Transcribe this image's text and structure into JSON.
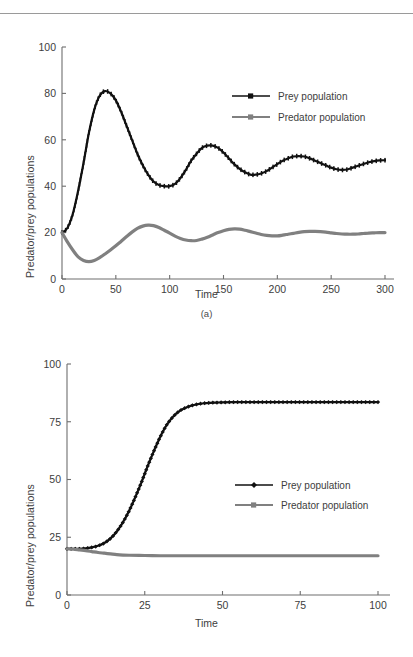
{
  "page": {
    "has_top_rule": true,
    "background": "#ffffff"
  },
  "colors": {
    "prey": "#111111",
    "predator": "#808080",
    "axis": "#6e6e6e",
    "text": "#3d3d3d"
  },
  "figures": [
    {
      "id": "a",
      "caption": "(a)",
      "chart_data": {
        "type": "line",
        "title": "",
        "xlabel": "Time",
        "ylabel": "Predator/prey populations",
        "xlim": [
          0,
          300
        ],
        "ylim": [
          0,
          100
        ],
        "xticks": [
          0,
          50,
          100,
          150,
          200,
          250,
          300
        ],
        "yticks": [
          0,
          20,
          40,
          60,
          80,
          100
        ],
        "grid": false,
        "legend_position": "upper-right-inside",
        "series": [
          {
            "name": "Prey population",
            "marker": "dot",
            "color": "#111111",
            "x": [
              0,
              5,
              10,
              15,
              20,
              25,
              30,
              35,
              40,
              45,
              50,
              55,
              60,
              65,
              70,
              75,
              80,
              85,
              90,
              95,
              100,
              105,
              110,
              115,
              120,
              125,
              130,
              135,
              140,
              145,
              150,
              155,
              160,
              165,
              170,
              175,
              180,
              185,
              190,
              195,
              200,
              205,
              210,
              215,
              220,
              225,
              230,
              235,
              240,
              245,
              250,
              255,
              260,
              265,
              270,
              275,
              280,
              285,
              290,
              295,
              300
            ],
            "y": [
              20,
              22,
              28,
              38,
              50,
              63,
              73,
              79,
              81,
              80,
              77,
              72,
              66,
              60,
              54,
              49,
              45,
              42,
              40.5,
              40,
              40,
              41,
              43.5,
              47,
              51,
              54,
              56.5,
              57.5,
              57.5,
              56.5,
              54.5,
              52,
              49.5,
              47.5,
              46,
              45,
              45,
              45.5,
              46.5,
              48,
              49.5,
              51,
              52,
              52.8,
              53,
              52.8,
              52,
              51,
              50,
              49,
              48,
              47.3,
              47,
              47.2,
              48,
              48.8,
              49.6,
              50.3,
              50.8,
              51.1,
              51.2
            ]
          },
          {
            "name": "Predator population",
            "marker": "square",
            "color": "#808080",
            "x": [
              0,
              5,
              10,
              15,
              20,
              25,
              30,
              35,
              40,
              45,
              50,
              55,
              60,
              65,
              70,
              75,
              80,
              85,
              90,
              95,
              100,
              105,
              110,
              115,
              120,
              125,
              130,
              135,
              140,
              145,
              150,
              155,
              160,
              165,
              170,
              175,
              180,
              185,
              190,
              195,
              200,
              205,
              210,
              215,
              220,
              225,
              230,
              235,
              240,
              245,
              250,
              255,
              260,
              265,
              270,
              275,
              280,
              285,
              290,
              295,
              300
            ],
            "y": [
              20,
              16,
              12.5,
              9.5,
              8,
              7.5,
              8,
              9.2,
              10.8,
              12.5,
              14.3,
              16.3,
              18.3,
              20.2,
              21.8,
              22.8,
              23.2,
              23,
              22.2,
              21,
              19.8,
              18.5,
              17.5,
              16.8,
              16.5,
              16.6,
              17.2,
              18,
              19,
              20,
              20.8,
              21.4,
              21.6,
              21.5,
              21,
              20.4,
              19.8,
              19.2,
              18.8,
              18.6,
              18.6,
              18.9,
              19.3,
              19.7,
              20.1,
              20.4,
              20.5,
              20.5,
              20.4,
              20.2,
              19.9,
              19.6,
              19.4,
              19.3,
              19.3,
              19.4,
              19.6,
              19.8,
              19.9,
              20,
              20
            ]
          }
        ]
      }
    },
    {
      "id": "b",
      "caption": "",
      "chart_data": {
        "type": "line",
        "title": "",
        "xlabel": "Time",
        "ylabel": "Predator/prey populations",
        "xlim": [
          0,
          100
        ],
        "ylim": [
          0,
          100
        ],
        "xticks": [
          0,
          25,
          50,
          75,
          100
        ],
        "yticks": [
          0,
          25,
          50,
          75,
          100
        ],
        "grid": false,
        "legend_position": "center-right-inside",
        "series": [
          {
            "name": "Prey population",
            "marker": "diamond",
            "color": "#111111",
            "x": [
              0,
              2,
              4,
              6,
              8,
              10,
              12,
              14,
              16,
              18,
              20,
              22,
              24,
              26,
              28,
              30,
              32,
              34,
              36,
              38,
              40,
              42,
              44,
              46,
              48,
              50,
              55,
              60,
              65,
              70,
              75,
              80,
              85,
              90,
              95,
              100
            ],
            "y": [
              20,
              20,
              20,
              20.2,
              20.6,
              21.3,
              22.5,
              24.5,
              27.5,
              31.5,
              36.5,
              42.5,
              49,
              56,
              62.5,
              68.5,
              73.5,
              77,
              79.5,
              81,
              82,
              82.6,
              83,
              83.2,
              83.3,
              83.4,
              83.5,
              83.5,
              83.5,
              83.5,
              83.5,
              83.5,
              83.5,
              83.5,
              83.5,
              83.5
            ]
          },
          {
            "name": "Predator population",
            "marker": "square",
            "color": "#808080",
            "x": [
              0,
              2,
              4,
              6,
              8,
              10,
              12,
              14,
              16,
              18,
              20,
              25,
              30,
              35,
              40,
              45,
              50,
              55,
              60,
              65,
              70,
              75,
              80,
              85,
              90,
              95,
              100
            ],
            "y": [
              20,
              19.8,
              19.5,
              19.2,
              18.8,
              18.4,
              18.1,
              17.8,
              17.5,
              17.3,
              17.2,
              17.1,
              17.0,
              17.0,
              17.0,
              17.0,
              17.0,
              17.0,
              17.0,
              17.0,
              17.0,
              17.0,
              17.0,
              17.0,
              17.0,
              17.0,
              17.0
            ]
          }
        ]
      }
    }
  ]
}
